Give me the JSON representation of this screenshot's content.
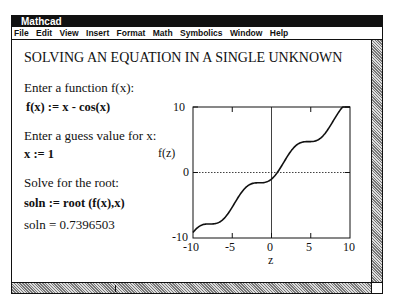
{
  "window": {
    "title": "Mathcad",
    "menu": [
      "File",
      "Edit",
      "View",
      "Insert",
      "Format",
      "Math",
      "Symbolics",
      "Window",
      "Help"
    ]
  },
  "worksheet": {
    "heading": "SOLVING AN EQUATION IN A SINGLE UNKNOWN",
    "prompt_function": "Enter a function f(x):",
    "function_def": "f(x) := x - cos(x)",
    "prompt_guess": "Enter a guess value for x:",
    "guess_def": "x := 1",
    "prompt_solve": "Solve for the root:",
    "solve_def": "soln := root (f(x),x)",
    "result": "soln = 0.7396503"
  },
  "chart_data": {
    "type": "line",
    "title": "",
    "xlabel": "z",
    "ylabel": "f(z)",
    "xlim": [
      -10,
      10
    ],
    "ylim": [
      -10,
      10
    ],
    "xticks": [
      "-10",
      "-5",
      "0",
      "5",
      "10"
    ],
    "yticks": [
      "10",
      "0",
      "-10"
    ],
    "function": "f(z) = z - cos(z)",
    "series": [
      {
        "name": "f(z)",
        "x": [
          -10,
          -9,
          -8,
          -7,
          -6,
          -5,
          -4,
          -3,
          -2,
          -1,
          0,
          1,
          2,
          3,
          4,
          5,
          6,
          7,
          8,
          9,
          10
        ],
        "values": [
          -9.16,
          -8.09,
          -7.85,
          -7.75,
          -6.96,
          -5.28,
          -3.35,
          -2.01,
          -1.58,
          -1.54,
          -1.0,
          0.46,
          2.42,
          3.99,
          4.65,
          4.72,
          5.04,
          6.25,
          8.15,
          9.91,
          10.84
        ]
      }
    ],
    "reference_lines": {
      "y0_dotted": true,
      "x0_solid": true
    },
    "grid": false
  }
}
